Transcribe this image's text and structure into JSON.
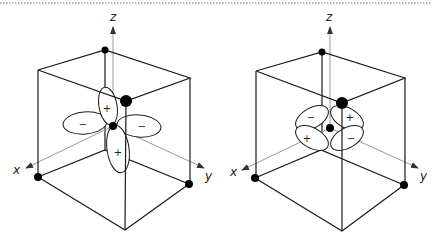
{
  "figure": {
    "border": "dotted-top-rule",
    "diagrams": [
      {
        "name": "left",
        "axes": {
          "x": "x",
          "y": "y",
          "z": "z"
        },
        "lobe_signs": {
          "top": "+",
          "left": "−",
          "right": "−",
          "bottom": "+"
        }
      },
      {
        "name": "right",
        "axes": {
          "x": "x",
          "y": "y",
          "z": "z"
        },
        "lobe_signs": {
          "upper_left": "−",
          "upper_right": "+",
          "lower_left": "+",
          "lower_right": "−"
        }
      }
    ]
  }
}
